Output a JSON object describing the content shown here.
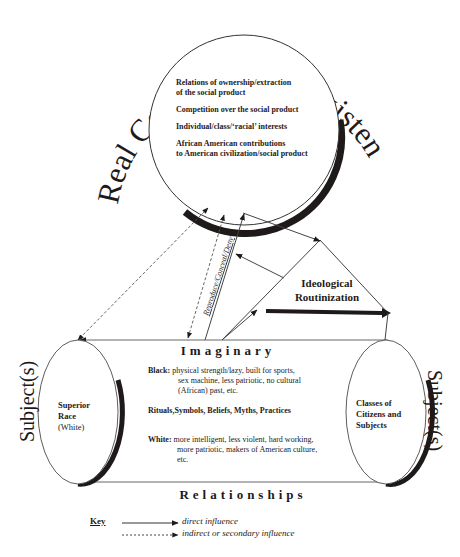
{
  "diagram": {
    "title": "Real Conditions of Existence",
    "real_conditions": {
      "items": [
        "Relations of ownership/extraction of the social product",
        "Competition over the social product",
        "Individual/class/'racial' interests",
        "African American contributions to American civilization/social product"
      ],
      "item_lines": [
        [
          "Relations of ownership/extraction",
          "of the social product"
        ],
        [
          "Competition over the social product"
        ],
        [
          "Individual/class/‘racial’ interests"
        ],
        [
          "African American contributions",
          "to American civilization/social product"
        ]
      ]
    },
    "arrow_label": "Reproduce/Conceal/Deny",
    "ideological_routinization": {
      "line1": "Ideological",
      "line2": "Routinization"
    },
    "left_subject": {
      "side_label": "Subject(s)",
      "line1": "Superior",
      "line2": "Race",
      "line3": "(White)"
    },
    "right_subject": {
      "side_label": "Subject(s)",
      "line1": "Classes of",
      "line2": "Citizens and",
      "line3": "Subjects"
    },
    "imaginary": {
      "heading": "Imaginary",
      "black_label": "Black:",
      "black_line1": "physical strength/lazy, built for sports,",
      "black_line2": "sex machine, less patriotic, no cultural",
      "black_line3": "(African) past, etc.",
      "rituals": "Rituals,Symbols, Beliefs, Myths, Practices",
      "white_label": "White:",
      "white_line1": "more intelligent, less violent, hard working,",
      "white_line2": "more patriotic, makers of American culture,",
      "white_line3": "etc."
    },
    "relationships_heading": "Relationships",
    "key": {
      "title": "Key",
      "direct": "direct influence",
      "indirect": "indirect or secondary influence"
    },
    "colors": {
      "ink": "#1e1a1a",
      "line": "#555555",
      "background": "#ffffff"
    }
  }
}
